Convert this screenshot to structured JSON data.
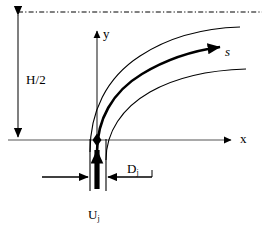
{
  "figure": {
    "type": "schematic-diagram",
    "background_color": "#ffffff",
    "line_color": "#000000",
    "width": 264,
    "height": 236
  },
  "axes": {
    "x_axis_label": "x",
    "y_axis_label": "y",
    "origin_marker": "diamond-marker"
  },
  "labels": {
    "channel_half_height": "H/2",
    "jet_velocity": "U",
    "jet_velocity_subscript": "j",
    "jet_diameter": "D",
    "jet_diameter_subscript": "j",
    "trajectory_coordinate": "s"
  },
  "geometry": {
    "origin": {
      "x": 97,
      "y": 140
    },
    "x_axis": {
      "x_start": 8,
      "x_end": 232,
      "y": 140
    },
    "y_axis": {
      "x": 97,
      "y_start": 140,
      "y_end": 30
    },
    "top_centerline": {
      "y": 12,
      "x_start": 18,
      "x_end": 262,
      "style": "dash-dot"
    },
    "half_height_dimension": {
      "x": 18,
      "y_top": 14,
      "y_bottom": 140,
      "arrowheads": "both"
    },
    "nozzle": {
      "left_wall_x": 90,
      "right_wall_x": 106,
      "top_y": 140,
      "bottom_y": 190
    },
    "diameter_dimension": {
      "y": 177,
      "left_arrow_from_x": 42,
      "left_arrow_to_x": 89,
      "right_arrow_from_x": 150,
      "right_arrow_to_x": 107
    },
    "jet_arrow": {
      "x": 97,
      "y_start": 188,
      "y_end": 144,
      "style": "bold-up-arrow"
    }
  },
  "curves": {
    "centerline_trajectory": {
      "name": "jet-centerline-trajectory",
      "stroke_width": 2.6,
      "arrowhead": true,
      "path": "M 97,152 C 97,120 112,92 142,74 C 170,57 198,50 222,47"
    },
    "upper_boundary": {
      "name": "jet-upper-boundary",
      "stroke_width": 1.1,
      "arrowhead": false,
      "path": "M 90,152 C 90,112 106,78 140,56 C 172,35 208,28 240,27"
    },
    "lower_boundary": {
      "name": "jet-lower-boundary",
      "stroke_width": 1.1,
      "arrowhead": false,
      "path": "M 106,160 C 106,132 122,108 150,92 C 180,75 214,70 246,69"
    }
  }
}
